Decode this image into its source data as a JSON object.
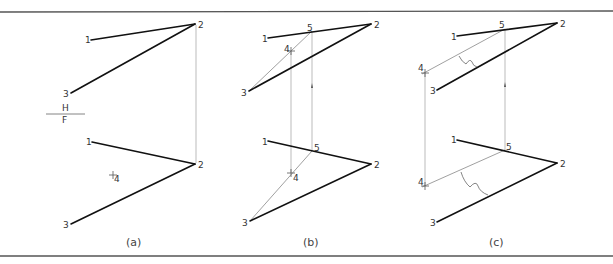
{
  "figure": {
    "frame": {
      "top_y": 12,
      "bottom_y": 256
    },
    "colors": {
      "line": "#111111",
      "thin": "#888888",
      "text": "#333333"
    },
    "fold_line": {
      "upper": "H",
      "lower": "F"
    },
    "panels": [
      {
        "id": "a",
        "caption": "(a)",
        "top_view": {
          "points": {
            "1": "1",
            "2": "2",
            "3": "3"
          }
        },
        "front_view": {
          "points": {
            "1": "1",
            "2": "2",
            "3": "3",
            "4": "4"
          }
        }
      },
      {
        "id": "b",
        "caption": "(b)",
        "top_view": {
          "points": {
            "1": "1",
            "2": "2",
            "3": "3",
            "4": "4",
            "5": "5"
          }
        },
        "front_view": {
          "points": {
            "1": "1",
            "2": "2",
            "3": "3",
            "4": "4",
            "5": "5"
          }
        }
      },
      {
        "id": "c",
        "caption": "(c)",
        "top_view": {
          "points": {
            "1": "1",
            "2": "2",
            "3": "3",
            "4": "4",
            "5": "5"
          }
        },
        "front_view": {
          "points": {
            "1": "1",
            "2": "2",
            "3": "3",
            "4": "4",
            "5": "5"
          }
        }
      }
    ]
  }
}
